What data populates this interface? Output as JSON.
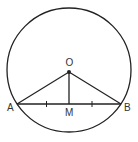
{
  "diagram": {
    "circle": {
      "cx": 69,
      "cy": 70,
      "r": 62
    },
    "points": {
      "O": {
        "label": "O",
        "x": 69,
        "y": 72
      },
      "A": {
        "label": "A",
        "x": 17,
        "y": 104
      },
      "B": {
        "label": "B",
        "x": 121,
        "y": 104
      },
      "M": {
        "label": "M",
        "x": 69,
        "y": 104
      }
    },
    "segments": [
      "OA",
      "OB",
      "OM",
      "AB"
    ],
    "tick_marks": [
      "AM",
      "MB"
    ],
    "stroke_color": "#222222"
  }
}
